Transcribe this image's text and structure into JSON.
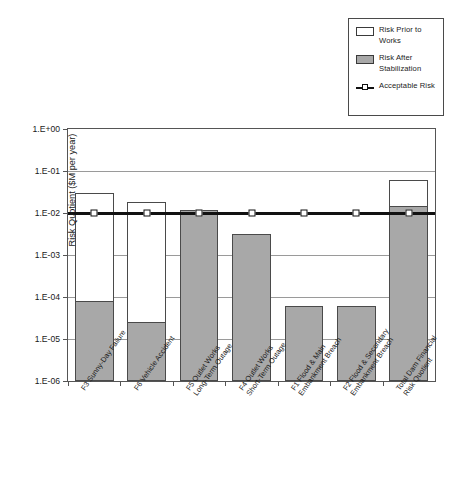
{
  "chart_data": {
    "type": "bar",
    "title": "",
    "xlabel": "",
    "ylabel": "Risk Quotient ($M per year)",
    "yscale": "log",
    "ylim": [
      1e-06,
      1
    ],
    "ytick_labels": [
      "1.E+00",
      "1.E-01",
      "1.E-02",
      "1.E-03",
      "1.E-04",
      "1.E-05",
      "1.E-06"
    ],
    "ytick_values": [
      1,
      0.1,
      0.01,
      0.001,
      0.0001,
      1e-05,
      1e-06
    ],
    "grid": true,
    "legend_position": "top-right",
    "categories": [
      "F3 Sunny-Day Failure",
      "F6 Vehicle Accident",
      "F5 Outlet Works Long-Term Outage",
      "F4 Outlet Works Short-Term Outage",
      "F1 Flood & Main Embankment Breach",
      "F2 Flood & Secondary Embankment Breach",
      "Total Dam Financial Risk Quotient"
    ],
    "series": [
      {
        "name": "Risk Prior to Works",
        "color": "#ffffff",
        "values": [
          0.03,
          0.018,
          0.012,
          0.0032,
          6e-05,
          6e-05,
          0.06
        ]
      },
      {
        "name": "Risk After Stabilization",
        "color": "#a8a8a8",
        "values": [
          8e-05,
          2.5e-05,
          0.012,
          0.0032,
          6e-05,
          6e-05,
          0.015
        ]
      },
      {
        "name": "Acceptable Risk",
        "color": "#111111",
        "type": "line",
        "values": [
          0.01,
          0.01,
          0.01,
          0.01,
          0.01,
          0.01,
          0.01
        ]
      }
    ]
  },
  "legend": {
    "items": [
      {
        "label": "Risk Prior to Works",
        "swatch": "white-rect-icon"
      },
      {
        "label": "Risk After Stabilization",
        "swatch": "grey-rect-icon"
      },
      {
        "label": "Acceptable Risk",
        "swatch": "line-marker-icon"
      }
    ]
  }
}
